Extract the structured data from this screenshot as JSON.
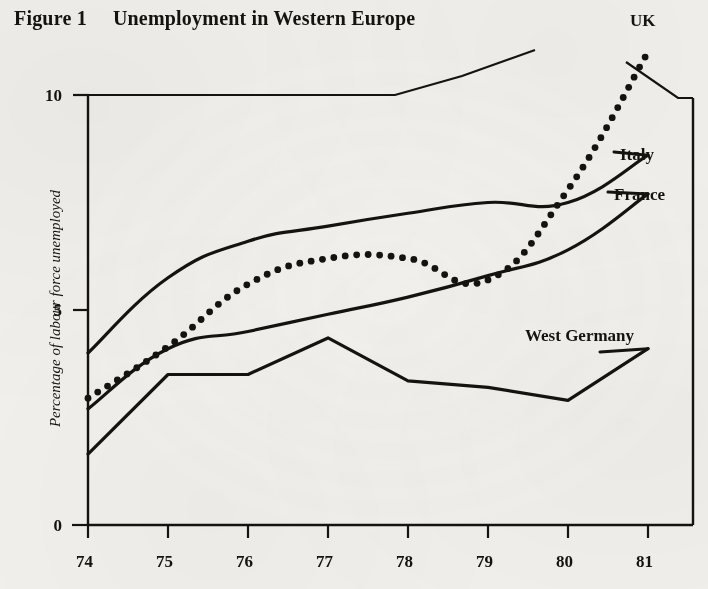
{
  "figure": {
    "number_label": "Figure 1",
    "title": "Unemployment in Western Europe"
  },
  "axes": {
    "ylabel": "Percentage of labour force unemployed",
    "yticks": [
      "0",
      "5",
      "10"
    ],
    "xticks": [
      "74",
      "75",
      "76",
      "77",
      "78",
      "79",
      "80",
      "81"
    ]
  },
  "series_labels": {
    "uk": "UK",
    "italy": "Italy",
    "france": "France",
    "west_germany": "West Germany"
  },
  "chart_data": {
    "type": "line",
    "title": "Unemployment in Western Europe",
    "subtitle": "Figure 1",
    "xlabel": "",
    "ylabel": "Percentage of labour force unemployed",
    "x": [
      74,
      75,
      76,
      77,
      78,
      79,
      80,
      81
    ],
    "xtick_labels": [
      "74",
      "75",
      "76",
      "77",
      "78",
      "79",
      "80",
      "81"
    ],
    "xlim": [
      74,
      81
    ],
    "ylim": [
      0,
      10
    ],
    "ytick_values": [
      0,
      5,
      10
    ],
    "grid": false,
    "legend_position": "inline-right-labels",
    "series": [
      {
        "name": "Italy",
        "style": "solid",
        "values": [
          4.0,
          5.75,
          6.6,
          6.95,
          7.25,
          7.5,
          7.5,
          8.6
        ]
      },
      {
        "name": "France",
        "style": "solid",
        "values": [
          2.7,
          4.1,
          4.5,
          4.9,
          5.3,
          5.8,
          6.4,
          7.7
        ]
      },
      {
        "name": "UK",
        "style": "dotted",
        "values": [
          2.95,
          4.15,
          5.6,
          6.2,
          6.2,
          5.7,
          7.8,
          11.0
        ]
      },
      {
        "name": "West Germany",
        "style": "solid",
        "values": [
          1.65,
          3.5,
          3.5,
          4.35,
          3.35,
          3.2,
          2.9,
          4.1
        ]
      }
    ]
  }
}
